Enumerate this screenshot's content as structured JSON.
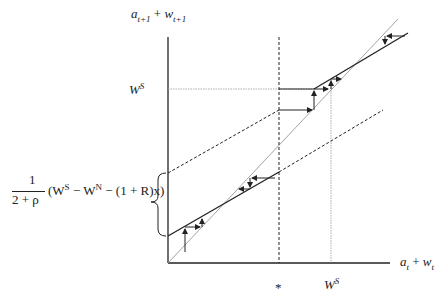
{
  "labels": {
    "y_axis": "a_{t+1} + w_{t+1}",
    "y_axis_main_a": "a",
    "y_axis_sub_a": "t+1",
    "y_axis_plus": " + ",
    "y_axis_main_w": "w",
    "y_axis_sub_w": "t+1",
    "x_axis_main_a": "a",
    "x_axis_sub_a": "t",
    "x_axis_plus": " + ",
    "x_axis_main_w": "w",
    "x_axis_sub_w": "t",
    "ws_y_main": "W",
    "ws_y_sup": "S",
    "ws_x_main": "W",
    "ws_x_sup": "S",
    "star": "*",
    "brace_frac_num": "1",
    "brace_frac_den": "2 + ρ",
    "brace_expr_open": "(W",
    "brace_expr_sup1": "S",
    "brace_expr_mid": " − W",
    "brace_expr_sup2": "N",
    "brace_expr_end": " − (1 + R)x)"
  },
  "colors": {
    "line": "#222222",
    "guide": "#999999"
  }
}
